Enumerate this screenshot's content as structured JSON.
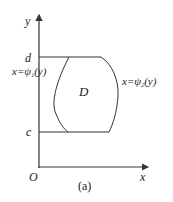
{
  "diagram": {
    "axis_labels": {
      "y": "y",
      "x": "x",
      "origin": "O"
    },
    "bounds": {
      "upper": "d",
      "lower": "c"
    },
    "region_label": "D",
    "left_curve": {
      "lhs": "x=",
      "func": "ψ",
      "sub": "1",
      "arg": "(y)"
    },
    "right_curve": {
      "lhs": "x=",
      "func": "ψ",
      "sub": "2",
      "arg": "(y)"
    },
    "caption": "(a)",
    "colors": {
      "stroke": "#333333",
      "text": "#222222",
      "background": "#ffffff"
    }
  }
}
